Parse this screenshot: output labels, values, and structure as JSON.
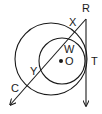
{
  "diagram": {
    "type": "geometry-circles",
    "labels": {
      "R": "R",
      "X": "X",
      "W": "W",
      "O": "O",
      "T": "T",
      "Y": "Y",
      "C": "C"
    },
    "colors": {
      "stroke": "#1a1a1a",
      "background": "#ffffff"
    }
  }
}
